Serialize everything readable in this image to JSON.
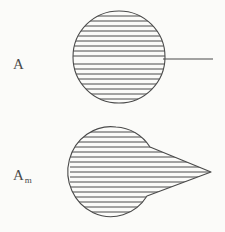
{
  "figure": {
    "background_color": "#fbfbf9",
    "ink_color": "#4a4a4a",
    "width": 225,
    "height": 232,
    "style": "scanned line drawing, horizontal hatch fill, no color"
  },
  "labels": {
    "top": {
      "base": "A",
      "subscript": "",
      "full_text": "A"
    },
    "bottom": {
      "base": "A",
      "subscript": "m",
      "full_text": "Am"
    }
  },
  "shapes": {
    "top": {
      "name": "hatched-circle",
      "label": "A",
      "center_x": 119,
      "center_y": 57,
      "radius_x": 46,
      "radius_y": 46,
      "hatch_lines": 18,
      "hatch_spacing": 5,
      "attachment": {
        "name": "horizontal-line",
        "from_x": 164,
        "to_x": 213,
        "y": 59
      }
    },
    "bottom": {
      "name": "hatched-circle-with-beak",
      "label": "Am",
      "center_x": 116,
      "center_y": 172,
      "radius_x": 43,
      "radius_y": 45,
      "hatch_lines": 18,
      "hatch_spacing": 5,
      "beak": {
        "name": "pointed-beak",
        "tip_x": 211,
        "tip_y": 172,
        "upper_root_x": 150,
        "upper_root_y": 147,
        "lower_root_x": 147,
        "lower_root_y": 196
      }
    }
  }
}
